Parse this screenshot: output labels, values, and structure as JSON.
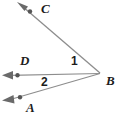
{
  "figure": {
    "background_color": "#ffffff",
    "line_color": "#8d8d8d",
    "point_color": "#555555",
    "label_color": "#1c1c1c"
  },
  "points": [
    {
      "id": "C",
      "label": "C",
      "x": 30,
      "y": 11
    },
    {
      "id": "D",
      "label": "D",
      "x": 17,
      "y": 75
    },
    {
      "id": "A",
      "label": "A",
      "x": 20,
      "y": 97
    },
    {
      "id": "B",
      "label": "B",
      "x": 100,
      "y": 73
    }
  ],
  "rays": [
    {
      "id": "ray-BC",
      "from": "B",
      "through": "C",
      "arrow_tip_x": 18,
      "arrow_tip_y": 3
    },
    {
      "id": "ray-BD",
      "from": "B",
      "through": "D",
      "arrow_tip_x": 3,
      "arrow_tip_y": 75
    },
    {
      "id": "ray-BA",
      "from": "B",
      "through": "A",
      "arrow_tip_x": 3,
      "arrow_tip_y": 99
    }
  ],
  "angles": [
    {
      "id": "angle-1",
      "label": "1",
      "between": "ray-BC and ray-BD"
    },
    {
      "id": "angle-2",
      "label": "2",
      "between": "ray-BD and ray-BA"
    }
  ]
}
